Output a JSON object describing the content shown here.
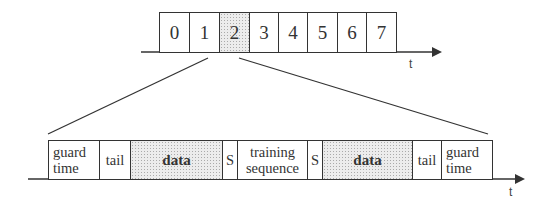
{
  "top_frame": {
    "slots": [
      {
        "label": "0",
        "shaded": false
      },
      {
        "label": "1",
        "shaded": false
      },
      {
        "label": "2",
        "shaded": true
      },
      {
        "label": "3",
        "shaded": false
      },
      {
        "label": "4",
        "shaded": false
      },
      {
        "label": "5",
        "shaded": false
      },
      {
        "label": "6",
        "shaded": false
      },
      {
        "label": "7",
        "shaded": false
      }
    ],
    "axis_label": "t"
  },
  "burst": {
    "fields": [
      {
        "label": "guard\ntime",
        "shaded": false
      },
      {
        "label": "tail",
        "shaded": false
      },
      {
        "label": "data",
        "shaded": true
      },
      {
        "label": "S",
        "shaded": false
      },
      {
        "label": "training\nsequence",
        "shaded": false
      },
      {
        "label": "S",
        "shaded": false
      },
      {
        "label": "data",
        "shaded": true
      },
      {
        "label": "tail",
        "shaded": false
      },
      {
        "label": "guard\ntime",
        "shaded": false
      }
    ],
    "axis_label": "t"
  },
  "colors": {
    "line": "#333333",
    "shade": "#ececec"
  }
}
